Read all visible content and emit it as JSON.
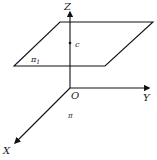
{
  "diagram": {
    "axes": {
      "z_label": "Z",
      "y_label": "Y",
      "x_label": "X",
      "origin_label": "O"
    },
    "planes": {
      "upper_plane_label": "π",
      "upper_plane_subscript": "1",
      "base_plane_label": "π"
    },
    "points": {
      "c_label": "c"
    },
    "colors": {
      "stroke": "#111111",
      "text": "#222222",
      "background": "#ffffff"
    }
  }
}
